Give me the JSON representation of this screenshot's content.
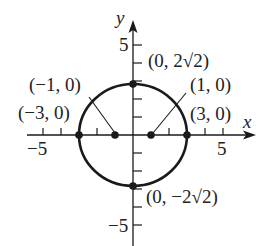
{
  "diagram": {
    "type": "ellipse-graph",
    "axes": {
      "x_label": "x",
      "y_label": "y",
      "x_tick_labels": [
        {
          "value": -5,
          "text": "−5"
        },
        {
          "value": 5,
          "text": "5"
        }
      ],
      "y_tick_labels": [
        {
          "value": 5,
          "text": "5"
        },
        {
          "value": -5,
          "text": "−5"
        }
      ],
      "x_range": [
        -6,
        6.7
      ],
      "y_range": [
        -6,
        6.3
      ],
      "tick_step": 1
    },
    "curve": {
      "equation": "x^2/9 + y^2/8 = 1",
      "center": [
        0,
        0
      ],
      "semi_axis_x": 3,
      "semi_axis_y": 2.828
    },
    "points": [
      {
        "id": "vertex-left",
        "coords": [
          -3,
          0
        ],
        "label": "(−3, 0)"
      },
      {
        "id": "vertex-right",
        "coords": [
          3,
          0
        ],
        "label": "(3, 0)"
      },
      {
        "id": "covertex-top",
        "coords": [
          0,
          2.828
        ],
        "label": "(0, 2√2)"
      },
      {
        "id": "covertex-bottom",
        "coords": [
          0,
          -2.828
        ],
        "label": "(0, −2√2)"
      },
      {
        "id": "focus-left",
        "coords": [
          -1,
          0
        ],
        "label": "(−1, 0)"
      },
      {
        "id": "focus-right",
        "coords": [
          1,
          0
        ],
        "label": "(1, 0)"
      }
    ],
    "colors": {
      "stroke": "#1a1a1a",
      "text": "#222222",
      "background": "#ffffff"
    }
  }
}
